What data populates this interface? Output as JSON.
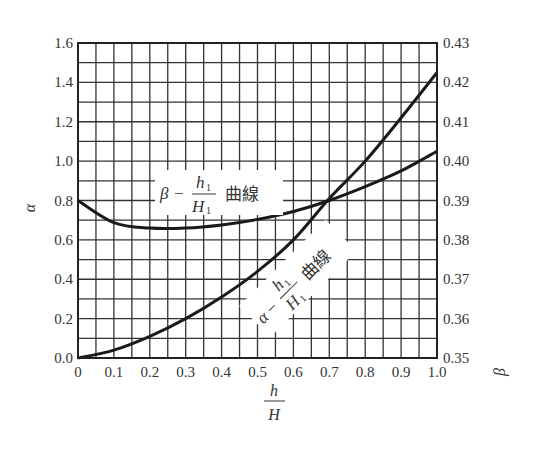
{
  "chart_data": {
    "type": "line",
    "title": "",
    "xlabel": "h/H",
    "ylabel": "α",
    "ylabel_right": "β",
    "xlim": [
      0,
      1.0
    ],
    "ylim": [
      0,
      1.6
    ],
    "ylim_right": [
      0.35,
      0.43
    ],
    "grid": true,
    "x_ticks": [
      "0",
      "0.1",
      "0.2",
      "0.3",
      "0.4",
      "0.5",
      "0.6",
      "0.7",
      "0.8",
      "0.9",
      "1.0"
    ],
    "y_ticks_left": [
      "0.0",
      "0.2",
      "0.4",
      "0.6",
      "0.8",
      "1.0",
      "1.2",
      "1.4",
      "1.6"
    ],
    "y_ticks_right": [
      "0.35",
      "0.36",
      "0.37",
      "0.38",
      "0.39",
      "0.40",
      "0.41",
      "0.42",
      "0.43"
    ],
    "x": [
      0,
      0.1,
      0.2,
      0.3,
      0.4,
      0.5,
      0.6,
      0.7,
      0.8,
      0.9,
      1.0
    ],
    "series": [
      {
        "name": "α - h1/H1 曲線",
        "axis": "left",
        "values": [
          0.0,
          0.04,
          0.11,
          0.2,
          0.31,
          0.44,
          0.6,
          0.81,
          1.0,
          1.22,
          1.45
        ]
      },
      {
        "name": "β - h1/H1 曲線",
        "axis": "right",
        "values": [
          0.39,
          0.3844,
          0.383,
          0.383,
          0.3838,
          0.3852,
          0.3872,
          0.39,
          0.3935,
          0.3975,
          0.4025
        ],
        "values_on_left_scale": [
          0.8,
          0.69,
          0.66,
          0.66,
          0.675,
          0.705,
          0.745,
          0.8,
          0.87,
          0.95,
          1.05
        ]
      }
    ],
    "annotations": [
      {
        "text_parts": [
          "β",
          "−",
          "h1",
          "H1",
          "曲線"
        ],
        "for": "β curve"
      },
      {
        "text_parts": [
          "α",
          "−",
          "h1",
          "H1",
          "曲線"
        ],
        "for": "α curve",
        "rotation": -45
      }
    ]
  },
  "labels": {
    "y_left": "α",
    "y_right": "β",
    "x_num": "h",
    "x_den": "H",
    "beta_label": {
      "sym": "β",
      "dash": "−",
      "num": "h",
      "num_sub": "1",
      "den": "H",
      "den_sub": "1",
      "suffix": "曲線"
    },
    "alpha_label": {
      "sym": "α",
      "dash": "−",
      "num": "h",
      "num_sub": "1",
      "den": "H",
      "den_sub": "1",
      "suffix": "曲線"
    }
  }
}
